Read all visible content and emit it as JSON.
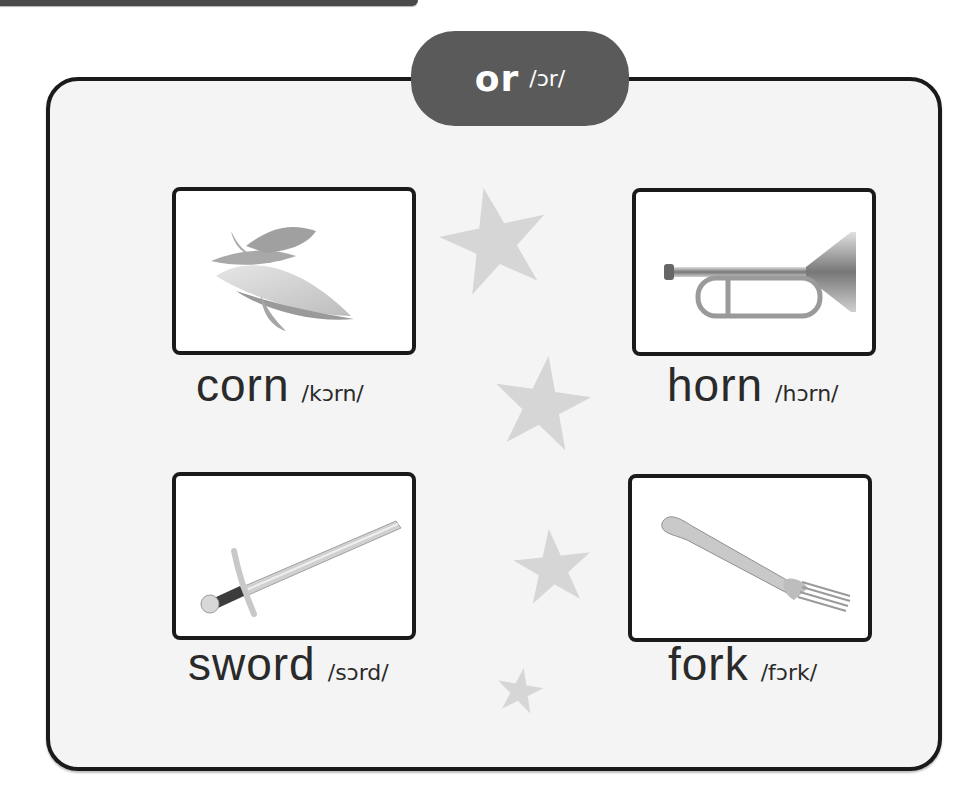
{
  "header": {
    "pattern": "or",
    "ipa": "/ɔr/"
  },
  "words": [
    {
      "word": "corn",
      "ipa": "/kɔrn/",
      "image": "corn-image"
    },
    {
      "word": "horn",
      "ipa": "/hɔrn/",
      "image": "horn-image"
    },
    {
      "word": "sword",
      "ipa": "/sɔrd/",
      "image": "sword-image"
    },
    {
      "word": "fork",
      "ipa": "/fɔrk/",
      "image": "fork-image"
    }
  ],
  "decorations": {
    "star_glyph": "★",
    "star_color": "#d6d6d6"
  },
  "colors": {
    "pill_background": "#5a5a5a",
    "border": "#1a1a1a",
    "panel_background": "#f4f4f4"
  }
}
